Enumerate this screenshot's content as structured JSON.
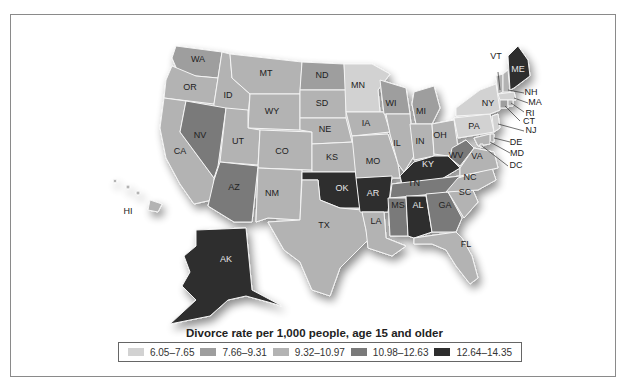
{
  "title": "Divorce rate per 1,000 people, age 15 and older",
  "legend": [
    {
      "range": "6.05–7.65",
      "color": "#d2d2d2"
    },
    {
      "range": "7.66–9.31",
      "color": "#9e9e9e"
    },
    {
      "range": "9.32–10.97",
      "color": "#b3b3b3"
    },
    {
      "range": "10.98–12.63",
      "color": "#7a7a7a"
    },
    {
      "range": "12.64–14.35",
      "color": "#2e2e2e"
    }
  ],
  "states": {
    "WA": "7.66–9.31",
    "OR": "9.32–10.97",
    "CA": "9.32–10.97",
    "ID": "9.32–10.97",
    "NV": "10.98–12.63",
    "MT": "9.32–10.97",
    "WY": "9.32–10.97",
    "UT": "9.32–10.97",
    "AZ": "10.98–12.63",
    "CO": "9.32–10.97",
    "NM": "9.32–10.97",
    "ND": "7.66–9.31",
    "SD": "9.32–10.97",
    "NE": "9.32–10.97",
    "KS": "9.32–10.97",
    "OK": "12.64–14.35",
    "TX": "9.32–10.97",
    "MN": "6.05–7.65",
    "IA": "9.32–10.97",
    "MO": "9.32–10.97",
    "AR": "12.64–14.35",
    "LA": "9.32–10.97",
    "WI": "7.66–9.31",
    "IL": "9.32–10.97",
    "MI": "7.66–9.31",
    "IN": "9.32–10.97",
    "OH": "9.32–10.97",
    "KY": "12.64–14.35",
    "TN": "10.98–12.63",
    "MS": "10.98–12.63",
    "AL": "12.64–14.35",
    "GA": "10.98–12.63",
    "FL": "9.32–10.97",
    "SC": "9.32–10.97",
    "NC": "9.32–10.97",
    "VA": "9.32–10.97",
    "WV": "10.98–12.63",
    "PA": "6.05–7.65",
    "NY": "6.05–7.65",
    "VT": "9.32–10.97",
    "NH": "9.32–10.97",
    "ME": "12.64–14.35",
    "MA": "6.05–7.65",
    "RI": "9.32–10.97",
    "CT": "7.66–9.31",
    "NJ": "6.05–7.65",
    "DE": "9.32–10.97",
    "MD": "9.32–10.97",
    "DC": "9.32–10.97",
    "AK": "12.64–14.35",
    "HI": "9.32–10.97"
  },
  "labels": {
    "WA": "WA",
    "OR": "OR",
    "CA": "CA",
    "ID": "ID",
    "NV": "NV",
    "MT": "MT",
    "WY": "WY",
    "UT": "UT",
    "AZ": "AZ",
    "CO": "CO",
    "NM": "NM",
    "ND": "ND",
    "SD": "SD",
    "NE": "NE",
    "KS": "KS",
    "OK": "OK",
    "TX": "TX",
    "MN": "MN",
    "IA": "IA",
    "MO": "MO",
    "AR": "AR",
    "LA": "LA",
    "WI": "WI",
    "IL": "IL",
    "MI": "MI",
    "IN": "IN",
    "OH": "OH",
    "KY": "KY",
    "TN": "TN",
    "MS": "MS",
    "AL": "AL",
    "GA": "GA",
    "FL": "FL",
    "SC": "SC",
    "NC": "NC",
    "VA": "VA",
    "WV": "WV",
    "PA": "PA",
    "NY": "NY",
    "VT": "VT",
    "NH": "NH",
    "ME": "ME",
    "MA": "MA",
    "RI": "RI",
    "CT": "CT",
    "NJ": "NJ",
    "DE": "DE",
    "MD": "MD",
    "DC": "DC",
    "AK": "AK",
    "HI": "HI"
  }
}
